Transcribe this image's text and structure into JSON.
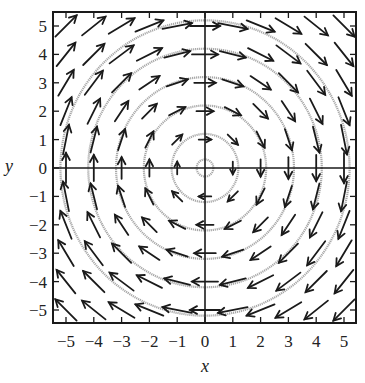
{
  "chart_data": {
    "type": "vector_field",
    "title": "",
    "xlabel": "x",
    "ylabel": "y",
    "field": "F(x, y) = (y, -x)",
    "rotation": "clockwise",
    "xlim": [
      -5.5,
      5.5
    ],
    "ylim": [
      -5.5,
      5.5
    ],
    "xticks": [
      -5,
      -4,
      -3,
      -2,
      -1,
      0,
      1,
      2,
      3,
      4,
      5
    ],
    "yticks": [
      -5,
      -4,
      -3,
      -2,
      -1,
      0,
      1,
      2,
      3,
      4,
      5
    ],
    "xtick_labels": [
      "−5",
      "−4",
      "−3",
      "−2",
      "−1",
      "0",
      "1",
      "2",
      "3",
      "4",
      "5"
    ],
    "ytick_labels": [
      "−5",
      "−4",
      "−3",
      "−2",
      "−1",
      "0",
      "1",
      "2",
      "3",
      "4",
      "5"
    ],
    "grid_points": {
      "x": [
        -5,
        -4,
        -3,
        -2,
        -1,
        0,
        1,
        2,
        3,
        4,
        5
      ],
      "y": [
        -5,
        -4,
        -3,
        -2,
        -1,
        0,
        1,
        2,
        3,
        4,
        5
      ]
    },
    "arrow_scale": "length grows with |F| then saturates",
    "flow_lines": {
      "shape": "concentric circles centered at origin",
      "radii": [
        0.3,
        1.2,
        2.2,
        3.2,
        4.2,
        5.2
      ],
      "color": "#a8a8a8"
    },
    "axes_lines": [
      "x=0",
      "y=0"
    ],
    "grid": false,
    "legend": null
  },
  "colors": {
    "arrow": "#1a1a1a",
    "frame": "#1a1a1a",
    "flow": "#a8a8a8"
  }
}
